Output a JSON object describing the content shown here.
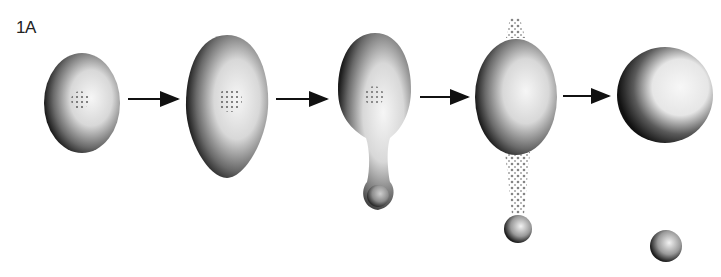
{
  "figure": {
    "panel_label": "1A",
    "stages": [
      {
        "name": "oval cell with nucleus"
      },
      {
        "name": "elongated egg-shaped cell with nucleus"
      },
      {
        "name": "cell with protruding bud"
      },
      {
        "name": "cell releasing granules and detached bud"
      },
      {
        "name": "round cell with separate small sphere"
      }
    ],
    "arrow_count": 4,
    "colors": {
      "background": "#ffffff",
      "shading_dark": "#1a1a1a",
      "shading_light": "#f2f2f2"
    }
  }
}
